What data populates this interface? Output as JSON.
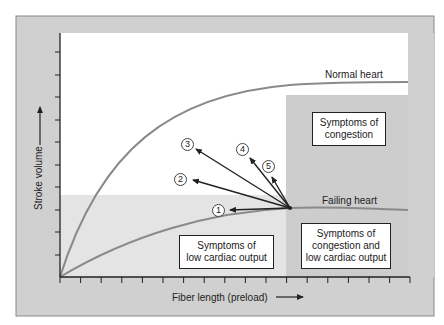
{
  "diagram": {
    "axes": {
      "x_label": "Fiber length (preload)",
      "y_label": "Stroke volume",
      "x_ticks": 18,
      "y_ticks": 11
    },
    "curves": [
      {
        "name": "normal",
        "label": "Normal heart",
        "color": "#8a8a8a"
      },
      {
        "name": "failing",
        "label": "Failing heart",
        "color": "#8a8a8a"
      }
    ],
    "regions": [
      {
        "name": "congestion",
        "label_line1": "Symptoms of",
        "label_line2": "congestion"
      },
      {
        "name": "low-output",
        "label_line1": "Symptoms of",
        "label_line2": "low cardiac output"
      },
      {
        "name": "congestion-and-low-output",
        "label_line1": "Symptoms of",
        "label_line2": "congestion and",
        "label_line3": "low cardiac output"
      }
    ],
    "markers": [
      {
        "id": "1",
        "label": "1"
      },
      {
        "id": "2",
        "label": "2"
      },
      {
        "id": "3",
        "label": "3"
      },
      {
        "id": "4",
        "label": "4"
      },
      {
        "id": "5",
        "label": "5"
      }
    ],
    "colors": {
      "frame_gray": "#cfcfcf",
      "region_light": "#e3e3e3",
      "region_dark": "#cdcdcd",
      "plot_white": "#ffffff",
      "line": "#222222"
    }
  }
}
